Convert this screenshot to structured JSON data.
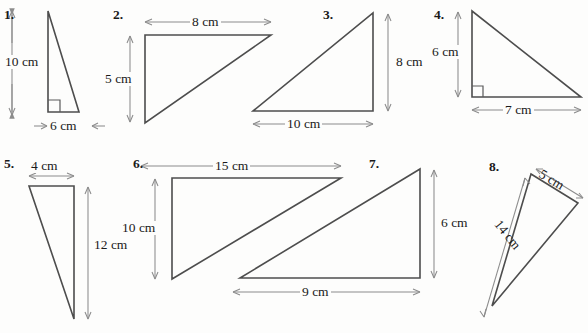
{
  "page": {
    "background_color": "#fdfdfc",
    "shape_stroke_color": "#4d4d4d",
    "dimension_stroke_color": "#8c8c8c",
    "text_color": "#1a1a1a"
  },
  "problems": [
    {
      "number": "1.",
      "shape": "right-triangle",
      "dimensions": [
        {
          "label": "10 cm",
          "orientation": "vertical"
        },
        {
          "label": "6 cm",
          "orientation": "horizontal"
        }
      ],
      "right_angle": true
    },
    {
      "number": "2.",
      "shape": "right-triangle",
      "dimensions": [
        {
          "label": "8 cm",
          "orientation": "horizontal"
        },
        {
          "label": "5 cm",
          "orientation": "vertical"
        }
      ],
      "right_angle": false
    },
    {
      "number": "3.",
      "shape": "right-triangle",
      "dimensions": [
        {
          "label": "8 cm",
          "orientation": "vertical"
        },
        {
          "label": "10 cm",
          "orientation": "horizontal"
        }
      ],
      "right_angle": false
    },
    {
      "number": "4.",
      "shape": "right-triangle",
      "dimensions": [
        {
          "label": "6 cm",
          "orientation": "vertical"
        },
        {
          "label": "7 cm",
          "orientation": "horizontal"
        }
      ],
      "right_angle": true
    },
    {
      "number": "5.",
      "shape": "right-triangle",
      "dimensions": [
        {
          "label": "4 cm",
          "orientation": "horizontal"
        },
        {
          "label": "12 cm",
          "orientation": "vertical"
        }
      ],
      "right_angle": false
    },
    {
      "number": "6.",
      "shape": "right-triangle",
      "dimensions": [
        {
          "label": "15 cm",
          "orientation": "horizontal"
        },
        {
          "label": "10 cm",
          "orientation": "vertical"
        }
      ],
      "right_angle": false
    },
    {
      "number": "7.",
      "shape": "right-triangle",
      "dimensions": [
        {
          "label": "6 cm",
          "orientation": "vertical"
        },
        {
          "label": "9 cm",
          "orientation": "horizontal"
        }
      ],
      "right_angle": false
    },
    {
      "number": "8.",
      "shape": "right-triangle",
      "dimensions": [
        {
          "label": "5 cm",
          "orientation": "diagonal"
        },
        {
          "label": "14 cm",
          "orientation": "diagonal"
        }
      ],
      "right_angle": false
    }
  ]
}
